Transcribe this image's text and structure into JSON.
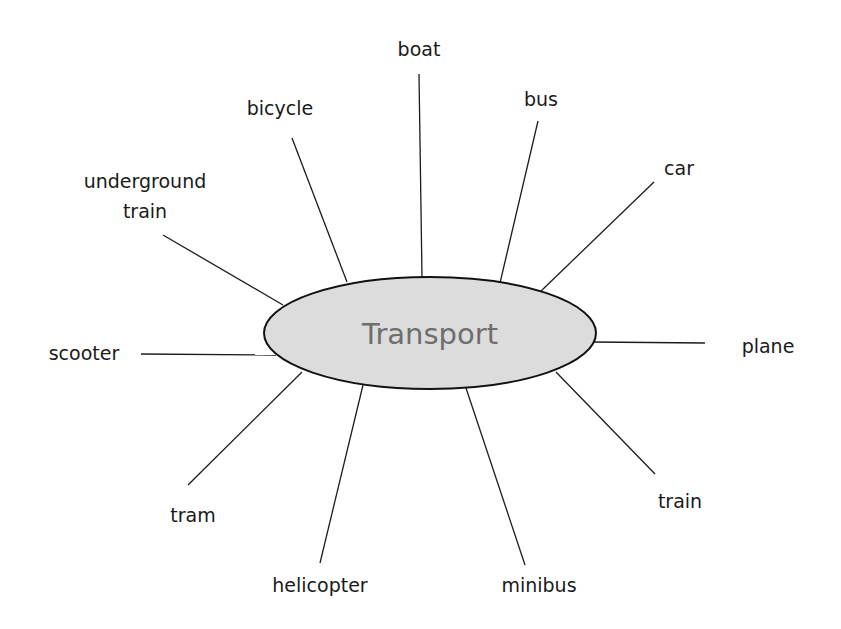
{
  "diagram": {
    "type": "mind-map",
    "center": {
      "label": "Transport",
      "fill": "#dcdcdc",
      "stroke": "#111111",
      "text_color": "#6e6e6e"
    },
    "branches": [
      {
        "label": "boat"
      },
      {
        "label": "bus"
      },
      {
        "label": "car"
      },
      {
        "label": "plane"
      },
      {
        "label": "train"
      },
      {
        "label": "minibus"
      },
      {
        "label": "helicopter"
      },
      {
        "label": "tram"
      },
      {
        "label": "scooter"
      },
      {
        "label": "underground",
        "label_line2": "train"
      },
      {
        "label": "bicycle"
      }
    ]
  }
}
